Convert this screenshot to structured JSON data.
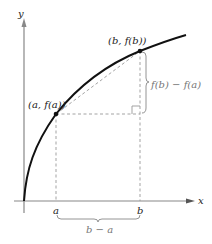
{
  "diagram": {
    "type": "mean-value-theorem-secant",
    "axes": {
      "x_label": "x",
      "y_label": "y"
    },
    "points": {
      "a": {
        "label": "(a, f(a))",
        "tick": "a"
      },
      "b": {
        "label": "(b, f(b))",
        "tick": "b"
      }
    },
    "annotations": {
      "rise": "f(b) − f(a)",
      "run": "b − a"
    },
    "colors": {
      "curve": "#111111",
      "axes": "#888888",
      "dashed": "#999999",
      "label_gray": "#777777"
    }
  }
}
